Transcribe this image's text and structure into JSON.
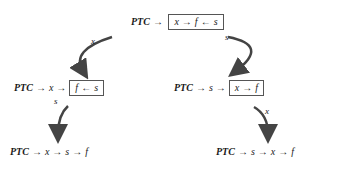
{
  "nodes": {
    "top": {
      "prefix": "PTC",
      "boxed": [
        "x",
        "f",
        "s"
      ],
      "arrows": [
        "→",
        "→",
        "←"
      ]
    },
    "mid_left": {
      "prefix": "PTC",
      "chain": [
        "x"
      ],
      "boxed": [
        "f",
        "s"
      ],
      "arrows": [
        "→",
        "→",
        "←"
      ]
    },
    "mid_right": {
      "prefix": "PTC",
      "chain": [
        "s"
      ],
      "boxed": [
        "x",
        "f"
      ],
      "arrows": [
        "→",
        "→",
        "→"
      ]
    },
    "bot_left": {
      "prefix": "PTC",
      "chain": [
        "x",
        "s",
        "f"
      ],
      "arrows": [
        "→",
        "→",
        "→"
      ]
    },
    "bot_right": {
      "prefix": "PTC",
      "chain": [
        "s",
        "x",
        "f"
      ],
      "arrows": [
        "→",
        "→",
        "→"
      ]
    }
  },
  "edges": [
    {
      "from": "top",
      "to": "mid_left",
      "label": "x"
    },
    {
      "from": "top",
      "to": "mid_right",
      "label": "s"
    },
    {
      "from": "mid_left",
      "to": "bot_left",
      "label": "s"
    },
    {
      "from": "mid_right",
      "to": "bot_right",
      "label": "x"
    }
  ],
  "colors": {
    "arrow": "#444444",
    "text": "#1a1a1a",
    "box": "#555555"
  }
}
